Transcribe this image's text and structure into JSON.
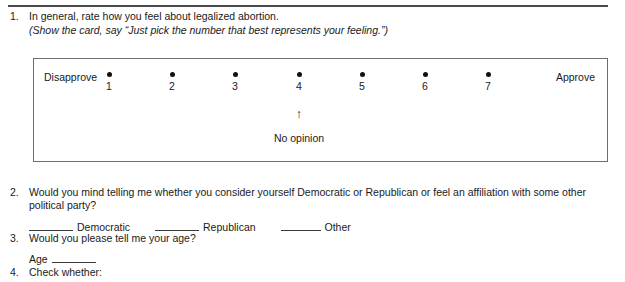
{
  "document": {
    "type": "survey-questionnaire"
  },
  "questions": [
    {
      "number": "1.",
      "text": "In general, rate how you feel about legalized abortion.",
      "instruction": "(Show the card, say “Just pick the number that best represents your feeling.”)"
    },
    {
      "number": "2.",
      "text": "Would you mind telling me whether you consider yourself Democratic or Republican or feel an affiliation with some other political party?",
      "options": [
        {
          "label": "Democratic"
        },
        {
          "label": "Republican"
        },
        {
          "label": "Other"
        }
      ]
    },
    {
      "number": "3.",
      "text": "Would you please tell me your age?",
      "field_label": "Age"
    },
    {
      "number": "4.",
      "text": "Check whether:"
    }
  ],
  "scale": {
    "low_label": "Disapprove",
    "high_label": "Approve",
    "points": [
      {
        "value": "1"
      },
      {
        "value": "2"
      },
      {
        "value": "3"
      },
      {
        "value": "4"
      },
      {
        "value": "5"
      },
      {
        "value": "6"
      },
      {
        "value": "7"
      }
    ],
    "annotation": {
      "arrow": "↑",
      "text": "No opinion",
      "points_to": "4"
    }
  },
  "colors": {
    "rule": "#4a4a4a",
    "box_border": "#6e6e6e",
    "dot": "#111111",
    "text": "#1a1a1a"
  }
}
